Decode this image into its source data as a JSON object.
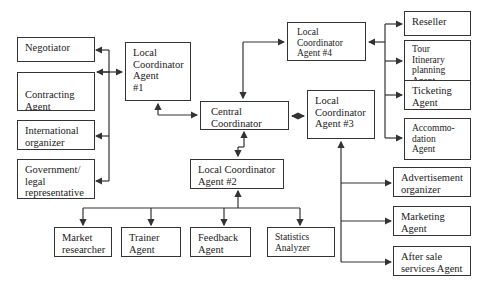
{
  "diagram": {
    "title": "",
    "nodes": {
      "central": {
        "lines": [
          "Central",
          "Coordinator"
        ]
      },
      "lca1": {
        "lines": [
          "Local",
          "Coordinator",
          "Agent",
          "#1"
        ]
      },
      "lca2": {
        "lines": [
          "Local Coordinator",
          "Agent #2"
        ]
      },
      "lca3": {
        "lines": [
          "Local",
          "Coordinator",
          "Agent #3"
        ]
      },
      "lca4": {
        "lines": [
          "Local",
          "Coordinator",
          "Agent #4"
        ]
      },
      "negotiator": {
        "lines": [
          "Negotiator"
        ]
      },
      "contracting": {
        "lines": [
          "Contracting",
          "Agent"
        ]
      },
      "international": {
        "lines": [
          "International",
          "organizer"
        ]
      },
      "government": {
        "lines": [
          "Government/",
          "legal",
          "representative"
        ]
      },
      "reseller": {
        "lines": [
          "Reseller"
        ]
      },
      "tour": {
        "lines": [
          "Tour Itinerary",
          "planning",
          "Agent"
        ]
      },
      "ticketing": {
        "lines": [
          "Ticketing",
          "Agent"
        ]
      },
      "accommodation": {
        "lines": [
          "Accommo-",
          "dation",
          "Agent"
        ]
      },
      "advertisement": {
        "lines": [
          "Advertisement",
          "organizer"
        ]
      },
      "marketing": {
        "lines": [
          "Marketing",
          "Agent"
        ]
      },
      "aftersale": {
        "lines": [
          "After sale",
          "services Agent"
        ]
      },
      "market": {
        "lines": [
          "Market",
          "researcher"
        ]
      },
      "trainer": {
        "lines": [
          "Trainer",
          "Agent"
        ]
      },
      "feedback": {
        "lines": [
          "Feedback",
          "Agent"
        ]
      },
      "statistics": {
        "lines": [
          "Statistics",
          "Analyzer"
        ]
      }
    },
    "edges": [
      {
        "from": "central",
        "to": "lca1",
        "type": "bidirectional"
      },
      {
        "from": "central",
        "to": "lca2",
        "type": "bidirectional"
      },
      {
        "from": "central",
        "to": "lca3",
        "type": "bidirectional"
      },
      {
        "from": "central",
        "to": "lca4",
        "type": "bidirectional"
      },
      {
        "from": "lca1",
        "to": "negotiator",
        "type": "directed"
      },
      {
        "from": "lca1",
        "to": "contracting",
        "type": "bidirectional"
      },
      {
        "from": "lca1",
        "to": "international",
        "type": "directed"
      },
      {
        "from": "lca1",
        "to": "government",
        "type": "directed"
      },
      {
        "from": "lca4",
        "to": "reseller",
        "type": "directed"
      },
      {
        "from": "lca4",
        "to": "tour",
        "type": "directed"
      },
      {
        "from": "lca4",
        "to": "ticketing",
        "type": "directed"
      },
      {
        "from": "lca4",
        "to": "accommodation",
        "type": "directed"
      },
      {
        "from": "lca3",
        "to": "advertisement",
        "type": "directed"
      },
      {
        "from": "lca3",
        "to": "marketing",
        "type": "directed"
      },
      {
        "from": "lca3",
        "to": "aftersale",
        "type": "directed"
      },
      {
        "from": "lca2",
        "to": "market",
        "type": "directed"
      },
      {
        "from": "lca2",
        "to": "trainer",
        "type": "directed"
      },
      {
        "from": "lca2",
        "to": "feedback",
        "type": "directed"
      },
      {
        "from": "lca2",
        "to": "statistics",
        "type": "directed"
      }
    ]
  }
}
